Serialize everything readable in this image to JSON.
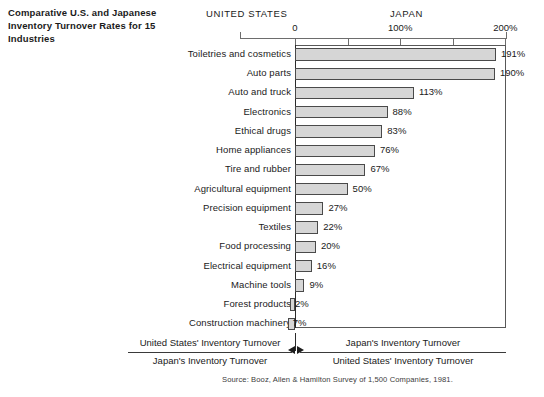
{
  "title": "Comparative U.S. and Japanese Inventory Turnover Rates for 15 Industries",
  "headers": {
    "left": "UNITED STATES",
    "right": "JAPAN"
  },
  "axis": {
    "ticks": [
      {
        "label": "0",
        "value": 0
      },
      {
        "label": "100%",
        "value": 100
      },
      {
        "label": "200%",
        "value": 200
      }
    ],
    "minor_ticks": [
      50,
      150
    ],
    "min": -14,
    "max": 200
  },
  "footer": {
    "left_numerator": "United States' Inventory Turnover",
    "left_denominator": "Japan's Inventory Turnover",
    "right_numerator": "Japan's Inventory Turnover",
    "right_denominator": "United States' Inventory Turnover",
    "source": "Source: Booz, Allen & Hamilton Survey of 1,500 Companies, 1981."
  },
  "colors": {
    "bar_fill": "#d6d6d6",
    "bar_border": "#4a4a4a",
    "axis": "#6d6d6d",
    "zero_line": "#2b2b2b",
    "text": "#1a1a1a"
  },
  "chart_data": {
    "type": "bar",
    "orientation": "horizontal",
    "title": "Comparative U.S. and Japanese Inventory Turnover Rates for 15 Industries",
    "xlabel": "",
    "ylabel": "",
    "xlim": [
      -14,
      200
    ],
    "grid": false,
    "legend": "none",
    "tick_labels": [
      "0",
      "100%",
      "200%"
    ],
    "note": "Positive values indicate Japan's inventory turnover exceeds the United States'; negative-direction bars (Forest products, Construction machinery) extend left of zero indicating the United States' turnover exceeds Japan's.",
    "categories": [
      "Toiletries and cosmetics",
      "Auto parts",
      "Auto and truck",
      "Electronics",
      "Ethical drugs",
      "Home appliances",
      "Tire and rubber",
      "Agricultural equipment",
      "Precision equipment",
      "Textiles",
      "Food processing",
      "Electrical equipment",
      "Machine tools",
      "Forest products",
      "Construction machinery"
    ],
    "values": [
      191,
      190,
      113,
      88,
      83,
      76,
      67,
      50,
      27,
      22,
      20,
      16,
      9,
      -2,
      -7
    ],
    "value_labels": [
      "191%",
      "190%",
      "113%",
      "88%",
      "83%",
      "76%",
      "67%",
      "50%",
      "27%",
      "22%",
      "20%",
      "16%",
      "9%",
      "2%",
      "7%"
    ]
  }
}
